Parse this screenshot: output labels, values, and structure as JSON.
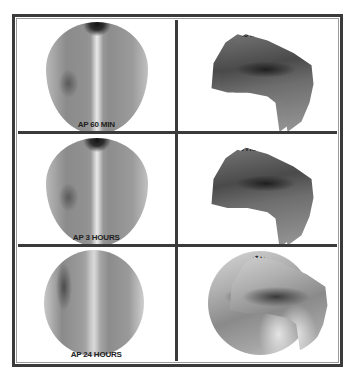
{
  "figure": {
    "panels": [
      {
        "row": 0,
        "col": 0,
        "view": "AP",
        "label": "AP 60 MIN"
      },
      {
        "row": 0,
        "col": 1,
        "view": "LAT D",
        "label": "LAT D 60 MIN"
      },
      {
        "row": 1,
        "col": 0,
        "view": "AP",
        "label": "AP 3 HOURS"
      },
      {
        "row": 1,
        "col": 1,
        "view": "LAT D",
        "label": "LAT D 3 HOURS"
      },
      {
        "row": 2,
        "col": 0,
        "view": "AP",
        "label": "AP 24 HOURS"
      },
      {
        "row": 2,
        "col": 1,
        "view": "LAT D",
        "label": "LAT D 24 HOURS"
      }
    ]
  },
  "colors": {
    "border": "#3a3a3a",
    "background": "#ffffff",
    "label_text": "#222222"
  }
}
